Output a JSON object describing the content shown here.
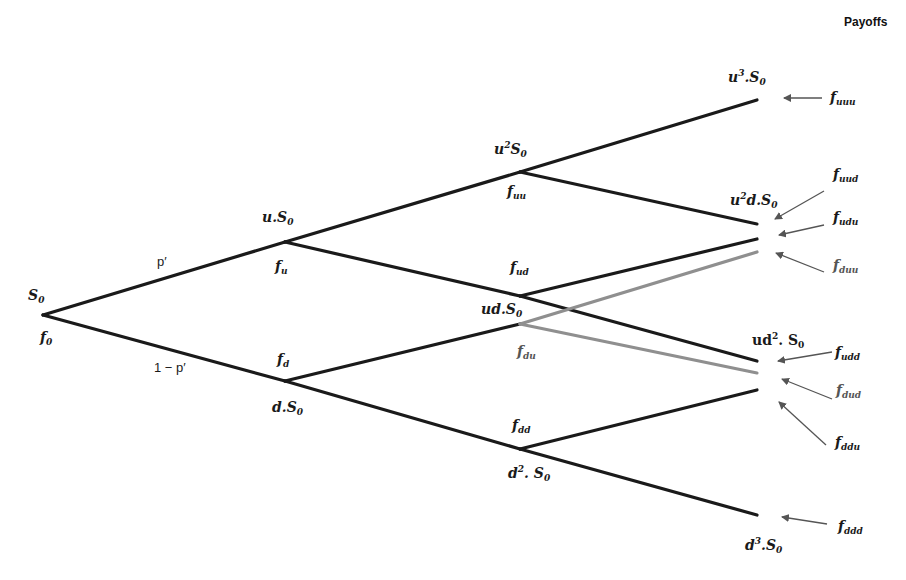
{
  "title": "Payoffs",
  "colors": {
    "branch": "#1a1a1a",
    "branch_alt": "#8f8f8f",
    "arrow": "#555555",
    "background": "#ffffff"
  },
  "probabilities": {
    "up": "p′",
    "down": "1 − p′"
  },
  "nodes": {
    "root": {
      "price": "S0",
      "payoff": "f0"
    },
    "u": {
      "price": "u.S0",
      "payoff": "fu"
    },
    "d": {
      "price": "d.S0",
      "payoff": "fd"
    },
    "uu": {
      "price": "u²S0",
      "payoff": "fuu"
    },
    "ud": {
      "price": "ud.S0",
      "payoff": "fud"
    },
    "du": {
      "price": "",
      "payoff": "fdu"
    },
    "dd": {
      "price": "d².S0",
      "payoff": "fdd"
    }
  },
  "terminal_prices": [
    "u³.S0",
    "u²d.S0",
    "ud².S0",
    "d³.S0"
  ],
  "payoffs": [
    "fuuu",
    "fuud",
    "fudu",
    "fduu",
    "fudd",
    "fdud",
    "fddu",
    "fddd"
  ],
  "labels": {
    "root_price": "S",
    "root_price_sub": "0",
    "root_payoff": "f",
    "root_payoff_sub": "0",
    "u_price_pre": "u.S",
    "u_price_sub": "0",
    "u_payoff": "f",
    "u_payoff_sub": "u",
    "d_price_pre": "d.S",
    "d_price_sub": "0",
    "d_payoff": "f",
    "d_payoff_sub": "d",
    "uu_price_pre": "u",
    "uu_price_sup": "2",
    "uu_price_mid": "S",
    "uu_price_sub": "0",
    "uu_payoff": "f",
    "uu_payoff_sub": "uu",
    "ud_price_pre": "ud.S",
    "ud_price_sub": "0",
    "ud_payoff": "f",
    "ud_payoff_sub": "ud",
    "du_payoff": "f",
    "du_payoff_sub": "du",
    "dd_price_pre": "d",
    "dd_price_sup": "2",
    "dd_price_mid": ". S",
    "dd_price_sub": "0",
    "dd_payoff": "f",
    "dd_payoff_sub": "dd",
    "t_uuu_pre": "u",
    "t_uuu_sup": "3",
    "t_uuu_mid": ".S",
    "t_uuu_sub": "0",
    "t_uud_pre": "u",
    "t_uud_sup": "2",
    "t_uud_mid": "d.S",
    "t_uud_sub": "0",
    "t_udd_pre": "ud",
    "t_udd_sup": "2",
    "t_udd_mid": ". S",
    "t_udd_sub": "0",
    "t_ddd_pre": "d",
    "t_ddd_sup": "3",
    "t_ddd_mid": ".S",
    "t_ddd_sub": "0",
    "f": "f",
    "p_uuu": "uuu",
    "p_uud": "uud",
    "p_udu": "udu",
    "p_duu": "duu",
    "p_udd": "udd",
    "p_dud": "dud",
    "p_ddu": "ddu",
    "p_ddd": "ddd"
  }
}
